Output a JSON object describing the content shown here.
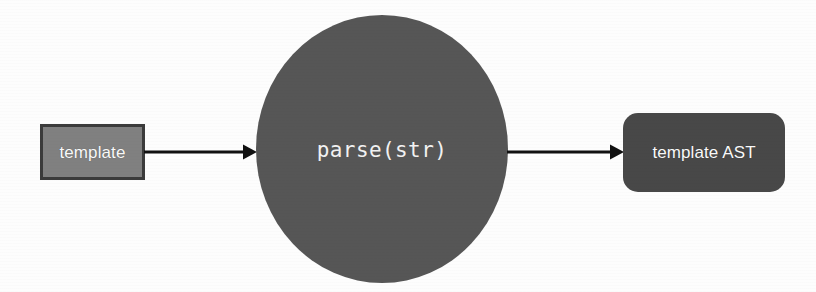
{
  "diagram": {
    "type": "flow",
    "background_color": "#fdfdfd",
    "nodes": [
      {
        "id": "template",
        "label": "template",
        "shape": "rectangle",
        "fill": "#808080",
        "stroke": "#3b3b3b",
        "text_color": "#fafafa",
        "font": "sans-serif"
      },
      {
        "id": "parse",
        "label": "parse(str)",
        "shape": "ellipse",
        "fill": "#565656",
        "stroke": "none",
        "text_color": "#f2f2f2",
        "font": "monospace"
      },
      {
        "id": "ast",
        "label": "template AST",
        "shape": "rounded-rectangle",
        "fill": "#484848",
        "stroke": "none",
        "text_color": "#fafafa",
        "font": "sans-serif"
      }
    ],
    "edges": [
      {
        "id": "template-to-parse",
        "from": "template",
        "to": "parse",
        "label": "",
        "color": "#111111",
        "arrowhead": "solid-triangle"
      },
      {
        "id": "parse-to-ast",
        "from": "parse",
        "to": "ast",
        "label": "",
        "color": "#111111",
        "arrowhead": "solid-triangle"
      }
    ]
  }
}
